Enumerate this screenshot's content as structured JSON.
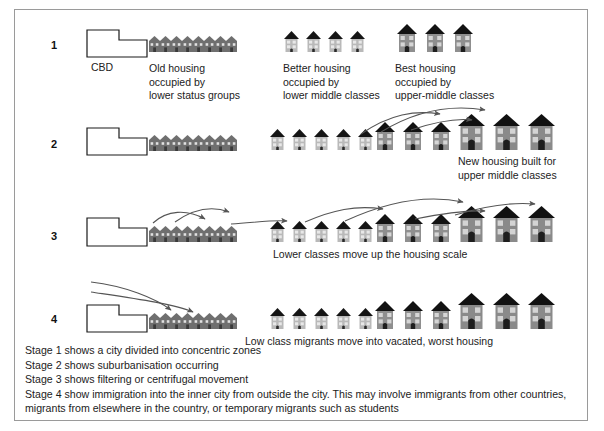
{
  "figure": {
    "border_color": "#9a9a9a",
    "background": "#ffffff"
  },
  "palette": {
    "roof_dark": "#1b1b1b",
    "wall_gray": "#8c8c8c",
    "wall_gray_light": "#b3b3b3",
    "window_light": "#dcdcdc",
    "arrow": "#555555",
    "outline": "#1a1a1a",
    "text": "#1c1c1c"
  },
  "stages": [
    {
      "number": "1",
      "cbd_label": "CBD",
      "captions": [
        {
          "id": "old-housing",
          "text": "Old housing\noccupied by\nlower status groups"
        },
        {
          "id": "better-housing",
          "text": "Better housing\noccupied by\nlower middle classes"
        },
        {
          "id": "best-housing",
          "text": "Best housing\noccupied by\nupper-middle classes"
        }
      ],
      "groups": [
        {
          "kind": "terrace",
          "count": 8
        },
        {
          "kind": "small",
          "count": 4
        },
        {
          "kind": "medium",
          "count": 3
        }
      ]
    },
    {
      "number": "2",
      "captions": [
        {
          "id": "new-housing",
          "text": "New housing built for\nupper middle classes"
        }
      ],
      "groups": [
        {
          "kind": "terrace",
          "count": 8
        },
        {
          "kind": "small",
          "count": 5
        },
        {
          "kind": "medium",
          "count": 3
        },
        {
          "kind": "large",
          "count": 3
        }
      ]
    },
    {
      "number": "3",
      "captions": [
        {
          "id": "lower-classes",
          "text": "Lower classes move up the housing scale"
        }
      ],
      "groups": [
        {
          "kind": "terrace",
          "count": 8
        },
        {
          "kind": "small",
          "count": 5
        },
        {
          "kind": "medium",
          "count": 3
        },
        {
          "kind": "large",
          "count": 3
        }
      ]
    },
    {
      "number": "4",
      "captions": [
        {
          "id": "low-class-migrants",
          "text": "Low class migrants move into vacated, worst housing"
        }
      ],
      "groups": [
        {
          "kind": "terrace",
          "count": 8
        },
        {
          "kind": "small",
          "count": 5
        },
        {
          "kind": "medium",
          "count": 3
        },
        {
          "kind": "large",
          "count": 3
        }
      ]
    }
  ],
  "notes": {
    "line1": "Stage 1 shows a city divided into concentric zones",
    "line2": "Stage 2 shows suburbanisation occurring",
    "line3": "Stage 3 shows filtering or centrifugal movement",
    "line4": "Stage 4 show immigration into the inner city from outside the city. This may involve immigrants from other countries, migrants from elsewhere in the country, or temporary migrants such as students"
  }
}
